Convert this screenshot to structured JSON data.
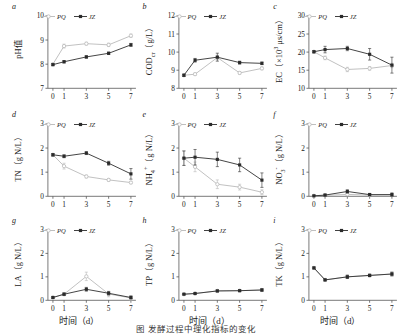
{
  "figure": {
    "caption": "图  发酵过程中理化指标的变化",
    "xlabel": "时间（d）",
    "series_names": {
      "pq": "PQ",
      "jz": "JZ"
    },
    "x_ticks": [
      "0",
      "1",
      "3",
      "5",
      "7"
    ]
  },
  "chart_data": [
    {
      "type": "line",
      "panel": "a",
      "title": "",
      "ylabel": "pH值",
      "xlabel": "时间（d）",
      "x": [
        0,
        1,
        3,
        5,
        7
      ],
      "xlim": [
        -0.45,
        7.45
      ],
      "ylim": [
        7,
        10
      ],
      "yticks": [
        7,
        8,
        9,
        10
      ],
      "xticks": [
        0,
        1,
        3,
        5,
        7
      ],
      "grid": false,
      "legend": "top-left",
      "series": [
        {
          "name": "PQ",
          "values": [
            8.0,
            8.75,
            8.85,
            8.8,
            9.18
          ],
          "errors": [
            0.04,
            0.08,
            0.06,
            0.07,
            0.07
          ]
        },
        {
          "name": "JZ",
          "values": [
            7.98,
            8.1,
            8.3,
            8.45,
            8.8
          ],
          "errors": [
            0.04,
            0.05,
            0.05,
            0.05,
            0.06
          ]
        }
      ]
    },
    {
      "type": "line",
      "panel": "b",
      "ylabel": "COD_cr（g/L）",
      "xlabel": "时间（d）",
      "x": [
        0,
        1,
        3,
        5,
        7
      ],
      "xlim": [
        -0.45,
        7.45
      ],
      "ylim": [
        8,
        12
      ],
      "yticks": [
        8,
        9,
        10,
        11,
        12
      ],
      "xticks": [
        0,
        1,
        3,
        5,
        7
      ],
      "grid": false,
      "legend": "top-left",
      "series": [
        {
          "name": "PQ",
          "values": [
            8.72,
            8.78,
            9.7,
            8.85,
            9.1
          ],
          "errors": [
            0.06,
            0.07,
            0.12,
            0.08,
            0.08
          ]
        },
        {
          "name": "JZ",
          "values": [
            8.72,
            9.55,
            9.72,
            9.42,
            9.38
          ],
          "errors": [
            0.06,
            0.1,
            0.22,
            0.08,
            0.07
          ]
        }
      ]
    },
    {
      "type": "line",
      "panel": "c",
      "ylabel": "EC（×10³ μs/cm）",
      "xlabel": "时间（d）",
      "x": [
        0,
        1,
        3,
        5,
        7
      ],
      "xlim": [
        -0.45,
        7.45
      ],
      "ylim": [
        10,
        30
      ],
      "yticks": [
        10,
        15,
        20,
        25,
        30
      ],
      "xticks": [
        0,
        1,
        3,
        5,
        7
      ],
      "grid": false,
      "legend": "top-left",
      "series": [
        {
          "name": "PQ",
          "values": [
            20.1,
            18.4,
            15.2,
            15.5,
            16.3
          ],
          "errors": [
            0.3,
            0.5,
            0.6,
            0.5,
            0.6
          ]
        },
        {
          "name": "JZ",
          "values": [
            20.1,
            20.7,
            21.0,
            19.4,
            16.4
          ],
          "errors": [
            0.3,
            0.9,
            0.6,
            1.6,
            2.2
          ]
        }
      ]
    },
    {
      "type": "line",
      "panel": "d",
      "ylabel": "TN（g N/L）",
      "xlabel": "时间（d）",
      "x": [
        0,
        1,
        3,
        5,
        7
      ],
      "xlim": [
        -0.45,
        7.45
      ],
      "ylim": [
        0,
        3
      ],
      "yticks": [
        0,
        1,
        2,
        3
      ],
      "xticks": [
        0,
        1,
        3,
        5,
        7
      ],
      "grid": false,
      "legend": "top-left",
      "series": [
        {
          "name": "PQ",
          "values": [
            1.72,
            1.25,
            0.82,
            0.68,
            0.57
          ],
          "errors": [
            0.05,
            0.12,
            0.06,
            0.06,
            0.05
          ]
        },
        {
          "name": "JZ",
          "values": [
            1.72,
            1.66,
            1.79,
            1.37,
            0.93
          ],
          "errors": [
            0.05,
            0.06,
            0.06,
            0.08,
            0.22
          ]
        }
      ]
    },
    {
      "type": "line",
      "panel": "e",
      "ylabel": "NH₄⁺（g N/L）",
      "xlabel": "时间（d）",
      "x": [
        0,
        1,
        3,
        5,
        7
      ],
      "xlim": [
        -0.45,
        7.45
      ],
      "ylim": [
        0,
        3
      ],
      "yticks": [
        0,
        1,
        2,
        3
      ],
      "xticks": [
        0,
        1,
        3,
        5,
        7
      ],
      "grid": false,
      "legend": "top-left",
      "series": [
        {
          "name": "PQ",
          "values": [
            1.58,
            1.22,
            0.5,
            0.38,
            0.17
          ],
          "errors": [
            0.3,
            0.2,
            0.18,
            0.12,
            0.1
          ]
        },
        {
          "name": "JZ",
          "values": [
            1.58,
            1.62,
            1.53,
            1.3,
            0.67
          ],
          "errors": [
            0.3,
            0.32,
            0.3,
            0.28,
            0.3
          ]
        }
      ]
    },
    {
      "type": "line",
      "panel": "f",
      "ylabel": "NO₃⁻（g N/L）",
      "xlabel": "时间（d）",
      "x": [
        0,
        1,
        3,
        5,
        7
      ],
      "xlim": [
        -0.45,
        7.45
      ],
      "ylim": [
        0,
        3
      ],
      "yticks": [
        0,
        1,
        2,
        3
      ],
      "xticks": [
        0,
        1,
        3,
        5,
        7
      ],
      "grid": false,
      "legend": "top-left",
      "series": [
        {
          "name": "PQ",
          "values": [
            0.02,
            0.04,
            0.08,
            0.05,
            0.06
          ],
          "errors": [
            0.02,
            0.03,
            0.05,
            0.04,
            0.06
          ]
        },
        {
          "name": "JZ",
          "values": [
            0.02,
            0.05,
            0.2,
            0.07,
            0.07
          ],
          "errors": [
            0.02,
            0.04,
            0.07,
            0.05,
            0.07
          ]
        }
      ]
    },
    {
      "type": "line",
      "panel": "g",
      "ylabel": "LA（g N/L）",
      "xlabel": "时间（d）",
      "x": [
        0,
        1,
        3,
        5,
        7
      ],
      "xlim": [
        -0.45,
        7.45
      ],
      "ylim": [
        0,
        3
      ],
      "yticks": [
        0,
        1,
        2,
        3
      ],
      "xticks": [
        0,
        1,
        3,
        5,
        7
      ],
      "grid": false,
      "legend": "top-left",
      "series": [
        {
          "name": "PQ",
          "values": [
            0.12,
            0.26,
            1.02,
            0.27,
            0.1
          ],
          "errors": [
            0.03,
            0.06,
            0.18,
            0.12,
            0.1
          ]
        },
        {
          "name": "JZ",
          "values": [
            0.12,
            0.26,
            0.47,
            0.3,
            0.12
          ],
          "errors": [
            0.03,
            0.05,
            0.08,
            0.07,
            0.06
          ]
        }
      ]
    },
    {
      "type": "line",
      "panel": "h",
      "ylabel": "TP（g N/L）",
      "xlabel": "时间（d）",
      "x": [
        0,
        1,
        3,
        5,
        7
      ],
      "xlim": [
        -0.45,
        7.45
      ],
      "ylim": [
        0,
        3
      ],
      "yticks": [
        0,
        1,
        2,
        3
      ],
      "xticks": [
        0,
        1,
        3,
        5,
        7
      ],
      "grid": false,
      "legend": "top-left",
      "series": [
        {
          "name": "PQ",
          "values": [
            0.26,
            0.29,
            0.4,
            0.41,
            0.44
          ],
          "errors": [
            0.02,
            0.02,
            0.04,
            0.03,
            0.05
          ]
        },
        {
          "name": "JZ",
          "values": [
            0.26,
            0.29,
            0.4,
            0.41,
            0.44
          ],
          "errors": [
            0.02,
            0.02,
            0.04,
            0.03,
            0.05
          ]
        }
      ]
    },
    {
      "type": "line",
      "panel": "i",
      "ylabel": "TK（g N/L）",
      "xlabel": "时间（d）",
      "x": [
        0,
        1,
        3,
        5,
        7
      ],
      "xlim": [
        -0.45,
        7.45
      ],
      "ylim": [
        0,
        3
      ],
      "yticks": [
        0,
        1,
        2,
        3
      ],
      "xticks": [
        0,
        1,
        3,
        5,
        7
      ],
      "grid": false,
      "legend": "top-left",
      "series": [
        {
          "name": "PQ",
          "values": [
            1.38,
            0.87,
            1.0,
            1.06,
            1.12
          ],
          "errors": [
            0.04,
            0.04,
            0.07,
            0.05,
            0.08
          ]
        },
        {
          "name": "JZ",
          "values": [
            1.38,
            0.87,
            1.0,
            1.06,
            1.12
          ],
          "errors": [
            0.04,
            0.04,
            0.07,
            0.05,
            0.08
          ]
        }
      ]
    }
  ]
}
